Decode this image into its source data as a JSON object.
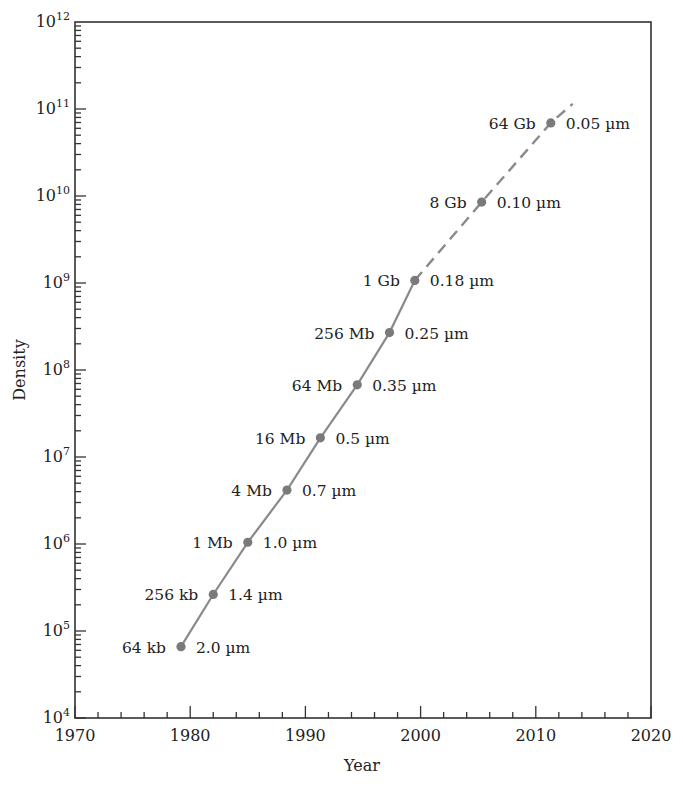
{
  "chart_data": {
    "type": "line",
    "title": "",
    "xlabel": "Year",
    "ylabel": "Density",
    "xlim": [
      1970,
      2020
    ],
    "ylim_log10": [
      4,
      12
    ],
    "yscale": "log",
    "grid": false,
    "legend": null,
    "x_ticks": [
      "1970",
      "1980",
      "1990",
      "2000",
      "2010",
      "2020"
    ],
    "y_ticks": [
      {
        "base": "10",
        "exp": "4"
      },
      {
        "base": "10",
        "exp": "5"
      },
      {
        "base": "10",
        "exp": "6"
      },
      {
        "base": "10",
        "exp": "7"
      },
      {
        "base": "10",
        "exp": "8"
      },
      {
        "base": "10",
        "exp": "9"
      },
      {
        "base": "10",
        "exp": "10"
      },
      {
        "base": "10",
        "exp": "11"
      },
      {
        "base": "10",
        "exp": "12"
      }
    ],
    "points": [
      {
        "year": 1979.2,
        "density": 65536,
        "log10": 4.82,
        "capacity": "64 kb",
        "feature": "2.0 µm",
        "projected": false
      },
      {
        "year": 1982.0,
        "density": 262144,
        "log10": 5.42,
        "capacity": "256 kb",
        "feature": "1.4 µm",
        "projected": false
      },
      {
        "year": 1985.0,
        "density": 1048576,
        "log10": 6.02,
        "capacity": "1 Mb",
        "feature": "1.0 µm",
        "projected": false
      },
      {
        "year": 1988.4,
        "density": 4194304,
        "log10": 6.62,
        "capacity": "4 Mb",
        "feature": "0.7 µm",
        "projected": false
      },
      {
        "year": 1991.3,
        "density": 16777216,
        "log10": 7.22,
        "capacity": "16 Mb",
        "feature": "0.5 µm",
        "projected": false
      },
      {
        "year": 1994.5,
        "density": 67108864,
        "log10": 7.83,
        "capacity": "64 Mb",
        "feature": "0.35 µm",
        "projected": false
      },
      {
        "year": 1997.3,
        "density": 268435456,
        "log10": 8.43,
        "capacity": "256 Mb",
        "feature": "0.25 µm",
        "projected": false
      },
      {
        "year": 1999.5,
        "density": 1073741824,
        "log10": 9.03,
        "capacity": "1 Gb",
        "feature": "0.18 µm",
        "projected": false
      },
      {
        "year": 2005.3,
        "density": 8589934592,
        "log10": 9.93,
        "capacity": "8 Gb",
        "feature": "0.10 µm",
        "projected": true
      },
      {
        "year": 2011.3,
        "density": 68719476736,
        "log10": 10.84,
        "capacity": "64 Gb",
        "feature": "0.05 µm",
        "projected": true
      }
    ],
    "projection_line_end": {
      "year": 2013.2,
      "log10": 11.06
    },
    "series_style": {
      "solid_until_year": 1999.5,
      "dashed_after_year": 1999.5
    },
    "colors": {
      "line": "#8a8a8a",
      "marker": "#7a7a7a",
      "axis": "#333333",
      "text": "#222222"
    }
  }
}
